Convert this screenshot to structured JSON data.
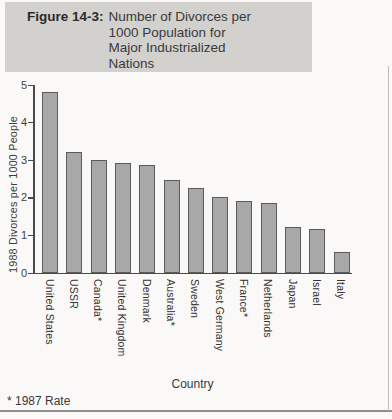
{
  "figure": {
    "label": "Figure 14-3:",
    "title_lines": [
      "Number of Divorces per",
      "1000 Population for",
      "Major Industrialized",
      "Nations"
    ]
  },
  "chart_data": {
    "type": "bar",
    "title": "Figure 14-3: Number of Divorces per 1000 Population for Major Industrialized Nations",
    "categories": [
      "United States",
      "USSR",
      "Canada*",
      "United Kingdom",
      "Denmark",
      "Australia*",
      "Sweden",
      "West Germany",
      "France*",
      "Netherlands",
      "Japan",
      "Israel",
      "Italy"
    ],
    "values": [
      4.8,
      3.2,
      3.0,
      2.9,
      2.85,
      2.45,
      2.25,
      2.0,
      1.9,
      1.85,
      1.2,
      1.15,
      0.55
    ],
    "xlabel": "Country",
    "ylabel": "1988 Divorces per 1000 People",
    "ylim": [
      0,
      5
    ],
    "yticks": [
      0,
      1,
      2,
      3,
      4,
      5
    ],
    "grid": "off",
    "legend": "none",
    "footnote": "* 1987 Rate",
    "bar_fill": "#a8a8a8",
    "bar_border": "#5c5c5c",
    "title_box_bg": "#d3d1ce"
  }
}
